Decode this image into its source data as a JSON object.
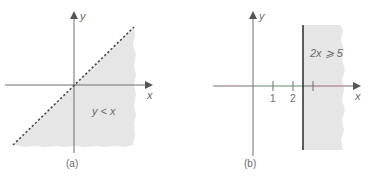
{
  "panels": [
    {
      "id": "a",
      "caption": "(a)",
      "x_label": "x",
      "y_label": "y",
      "region_label": "y < x",
      "boundary": {
        "equation": "y = x",
        "style": "dashed"
      },
      "shaded_side": "below-right of line"
    },
    {
      "id": "b",
      "caption": "(b)",
      "x_label": "x",
      "y_label": "y",
      "region_label": "2x ⩾ 5",
      "boundary": {
        "equation": "x = 2.5",
        "style": "solid"
      },
      "shaded_side": "right of line",
      "tick_labels": [
        "1",
        "2"
      ]
    }
  ],
  "colors": {
    "axis": "#6f6f6f",
    "shade": "#e6e6e6",
    "boundary": "#2a2a2a",
    "dashed": "#4a4a4a",
    "axis_tint_green": "#a8e0a8",
    "axis_tint_red": "#e0a8b4"
  }
}
